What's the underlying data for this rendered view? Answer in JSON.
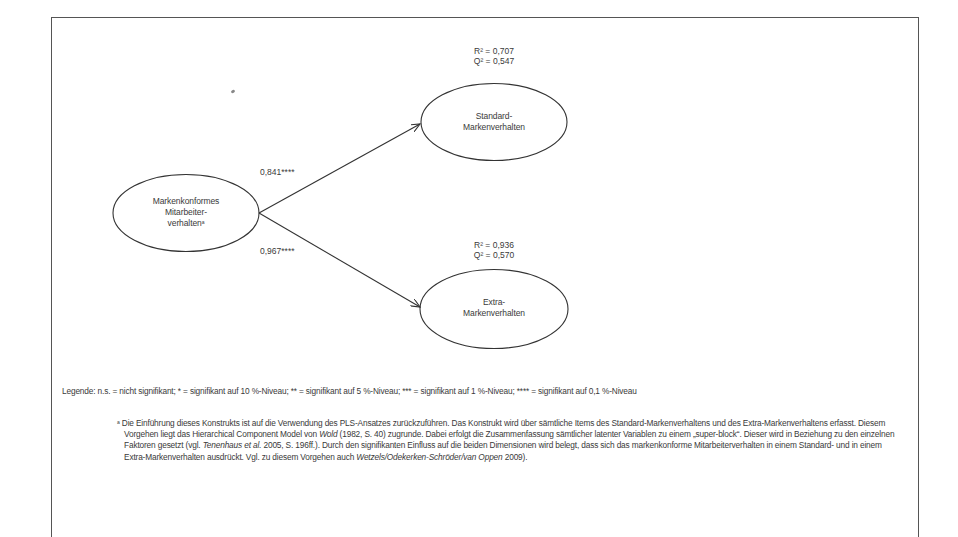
{
  "diagram": {
    "nodes": {
      "source": {
        "label_line1": "Markenkonformes",
        "label_line2": "Mitarbeiter-",
        "label_line3": "verhalten",
        "footnote_marker": "a"
      },
      "standard": {
        "label_line1": "Standard-",
        "label_line2": "Markenverhalten",
        "r2": "R² = 0,707",
        "q2": "Q² = 0,547"
      },
      "extra": {
        "label_line1": "Extra-",
        "label_line2": "Markenverhalten",
        "r2": "R² = 0,936",
        "q2": "Q² = 0,570"
      }
    },
    "paths": [
      {
        "from": "Markenkonformes Mitarbeiterverhalten",
        "to": "Standard-Markenverhalten",
        "coefficient": "0,841****"
      },
      {
        "from": "Markenkonformes Mitarbeiterverhalten",
        "to": "Extra-Markenverhalten",
        "coefficient": "0,967****"
      }
    ]
  },
  "legend": {
    "text": "Legende: n.s. = nicht signifikant; * = signifikant auf 10 %-Niveau; ** = signifikant auf 5 %-Niveau; *** = signifikant auf 1 %-Niveau; **** = signifikant auf 0,1 %-Niveau"
  },
  "footnote": {
    "marker": "a",
    "part1": " Die Einführung dieses Konstrukts ist auf die Verwendung des PLS-Ansatzes zurückzuführen. Das Konstrukt wird über sämtliche Items des Standard-Markenverhaltens und des Extra-Markenverhaltens erfasst. Diesem Vorgehen liegt das Hierarchical Component Model von ",
    "author1": "Wold",
    "part2": " (1982, S. 40) zugrunde. Dabei erfolgt die Zusammenfassung sämtlicher latenter Variablen zu einem „super-block“. Dieser wird in Beziehung zu den einzelnen Faktoren gesetzt (vgl. ",
    "author2": "Tenenhaus et al.",
    "part3": " 2005, S. 196ff.). Durch den signifikanten Einfluss auf die beiden Dimensionen wird belegt, dass sich das  markenkonforme Mitarbeiterverhalten in einem Standard- und in einem Extra-Markenverhalten ausdrückt. Vgl. zu diesem Vorgehen auch ",
    "author3": "Wetzels/Odekerken-Schröder/van Oppen",
    "part4": " 2009)."
  }
}
